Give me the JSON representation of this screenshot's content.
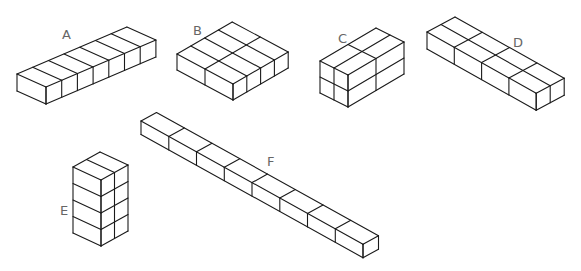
{
  "diagram": {
    "title": "",
    "background": "#ffffff",
    "line_color": "#1a1a1a",
    "label_color": "#666666",
    "shapes": [
      {
        "id": "A",
        "label": "A",
        "label_pos": [
          62,
          28
        ],
        "description": "1 x 7 x 1 row of cubes (flat bar)",
        "cubes_count": 7,
        "origin": [
          17,
          74
        ],
        "u": [
          29,
          13
        ],
        "u_count": 1,
        "v": [
          15.7,
          -6.7
        ],
        "v_count": 7,
        "h": 17,
        "h_count": 1
      },
      {
        "id": "B",
        "label": "B",
        "label_pos": [
          193,
          24
        ],
        "description": "2 x 4 x 1 flat slab of cubes",
        "cubes_count": 8,
        "origin": [
          177,
          54
        ],
        "u": [
          28,
          15
        ],
        "u_count": 2,
        "v": [
          13.8,
          -8
        ],
        "v_count": 4,
        "h": 16,
        "h_count": 1
      },
      {
        "id": "C",
        "label": "C",
        "label_pos": [
          338,
          32
        ],
        "description": "1 x 2 x 2 block of cubes with long top direction",
        "cubes_count": 8,
        "origin": [
          320,
          61
        ],
        "u": [
          14,
          7
        ],
        "u_count": 2,
        "v": [
          28,
          -16.5
        ],
        "v_count": 2,
        "h": 16,
        "h_count": 2
      },
      {
        "id": "D",
        "label": "D",
        "label_pos": [
          513,
          36
        ],
        "description": "4 x 2 x 1 bar of cubes",
        "cubes_count": 8,
        "origin": [
          427,
          32
        ],
        "u": [
          27.3,
          15.3
        ],
        "u_count": 4,
        "v": [
          14,
          -7.5
        ],
        "v_count": 2,
        "h": 17,
        "h_count": 1
      },
      {
        "id": "E",
        "label": "E",
        "label_pos": [
          60,
          204
        ],
        "description": "2 x 1 x 4 vertical tower of cubes",
        "cubes_count": 8,
        "origin": [
          73,
          167
        ],
        "u": [
          28,
          13
        ],
        "u_count": 1,
        "v": [
          13.5,
          -7.5
        ],
        "v_count": 2,
        "h": 16.5,
        "h_count": 4
      },
      {
        "id": "F",
        "label": "F",
        "label_pos": [
          267,
          155
        ],
        "description": "8 x 1 x 1 long bar of cubes",
        "cubes_count": 8,
        "origin": [
          141,
          121
        ],
        "u": [
          27.75,
          15.4
        ],
        "u_count": 8,
        "v": [
          15.5,
          -8.5
        ],
        "v_count": 1,
        "h": 13.5,
        "h_count": 1
      }
    ]
  }
}
